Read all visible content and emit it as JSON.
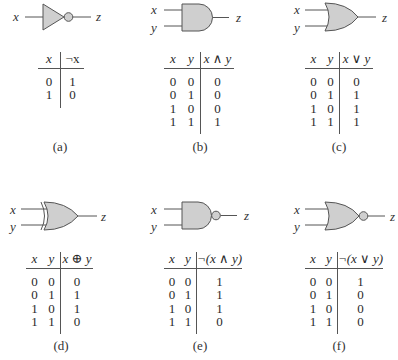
{
  "figure": {
    "panels": [
      {
        "id": "a",
        "gate": "NOT",
        "caption": "(a)",
        "input_labels": [
          "x"
        ],
        "output_label": "z",
        "headers": [
          "x",
          "¬x"
        ],
        "rows": [
          [
            "0",
            "1"
          ],
          [
            "1",
            "0"
          ]
        ]
      },
      {
        "id": "b",
        "gate": "AND",
        "caption": "(b)",
        "input_labels": [
          "x",
          "y"
        ],
        "output_label": "z",
        "headers": [
          "x",
          "y",
          "x ∧ y"
        ],
        "rows": [
          [
            "0",
            "0",
            "0"
          ],
          [
            "0",
            "1",
            "0"
          ],
          [
            "1",
            "0",
            "0"
          ],
          [
            "1",
            "1",
            "1"
          ]
        ]
      },
      {
        "id": "c",
        "gate": "OR",
        "caption": "(c)",
        "input_labels": [
          "x",
          "y"
        ],
        "output_label": "z",
        "headers": [
          "x",
          "y",
          "x ∨ y"
        ],
        "rows": [
          [
            "0",
            "0",
            "0"
          ],
          [
            "0",
            "1",
            "1"
          ],
          [
            "1",
            "0",
            "1"
          ],
          [
            "1",
            "1",
            "1"
          ]
        ]
      },
      {
        "id": "d",
        "gate": "XOR",
        "caption": "(d)",
        "input_labels": [
          "x",
          "y"
        ],
        "output_label": "z",
        "headers": [
          "x",
          "y",
          "x ⊕ y"
        ],
        "rows": [
          [
            "0",
            "0",
            "0"
          ],
          [
            "0",
            "1",
            "1"
          ],
          [
            "1",
            "0",
            "1"
          ],
          [
            "1",
            "1",
            "0"
          ]
        ]
      },
      {
        "id": "e",
        "gate": "NAND",
        "caption": "(e)",
        "input_labels": [
          "x",
          "y"
        ],
        "output_label": "z",
        "headers": [
          "x",
          "y",
          "¬(x ∧ y)"
        ],
        "rows": [
          [
            "0",
            "0",
            "1"
          ],
          [
            "0",
            "1",
            "1"
          ],
          [
            "1",
            "0",
            "1"
          ],
          [
            "1",
            "1",
            "0"
          ]
        ]
      },
      {
        "id": "f",
        "gate": "NOR",
        "caption": "(f)",
        "input_labels": [
          "x",
          "y"
        ],
        "output_label": "z",
        "headers": [
          "x",
          "y",
          "¬(x ∨ y)"
        ],
        "rows": [
          [
            "0",
            "0",
            "1"
          ],
          [
            "0",
            "1",
            "0"
          ],
          [
            "1",
            "0",
            "0"
          ],
          [
            "1",
            "1",
            "0"
          ]
        ]
      }
    ],
    "colors": {
      "gate_fill": "#cfcfcf",
      "stroke": "#555555",
      "text": "#2a2a2a"
    }
  }
}
